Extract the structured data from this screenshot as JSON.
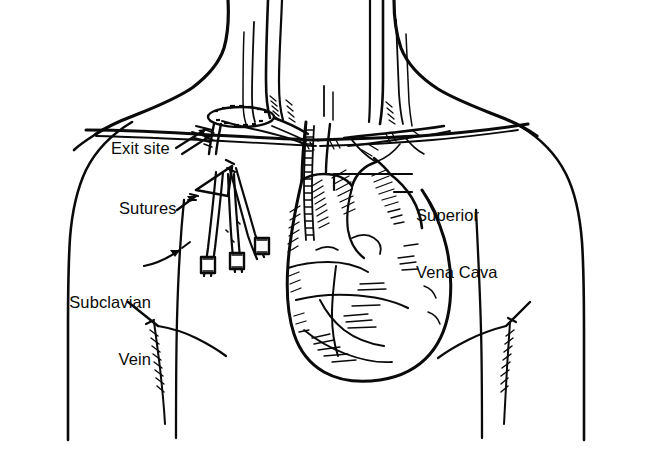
{
  "figure": {
    "background_color": "#ffffff",
    "ink_color": "#0a0a0a",
    "width": 652,
    "height": 450,
    "style": "black and white pen-and-ink line drawing with hatch shading"
  },
  "labels": [
    {
      "name": "exit-site",
      "text": "Exit site",
      "leader": "diagonal lines pointing up-right to catheter exit at the chest wall"
    },
    {
      "name": "sutures",
      "text": "Sutures",
      "leader": "short arrow pointing up-right to the suture wing"
    },
    {
      "name": "subclavian-vein",
      "line1": "Subclavian",
      "line2": "Vein",
      "leader": "curved arrow pointing up-right to the subclavian vein"
    },
    {
      "name": "superior-vena-cava",
      "line1": "Superior",
      "line2": "Vena Cava",
      "leader": "two horizontal bracket lines pointing left to the superior vena cava"
    }
  ],
  "anatomy": [
    {
      "name": "neck-outline",
      "label": "Neck"
    },
    {
      "name": "left-shoulder-outline",
      "label": "Left shoulder and arm"
    },
    {
      "name": "right-shoulder-outline",
      "label": "Right shoulder and arm"
    },
    {
      "name": "internal-jugular-veins",
      "label": "Internal jugular veins"
    },
    {
      "name": "carotid-arteries",
      "label": "Carotid arteries"
    },
    {
      "name": "clavicle",
      "label": "Clavicle"
    },
    {
      "name": "subclavian-vein-vessel",
      "label": "Subclavian vein"
    },
    {
      "name": "superior-vena-cava-vessel",
      "label": "Superior vena cava"
    },
    {
      "name": "aortic-arch",
      "label": "Aortic arch"
    },
    {
      "name": "heart",
      "label": "Heart"
    },
    {
      "name": "left-breast",
      "label": "Left breast"
    },
    {
      "name": "right-breast",
      "label": "Right breast"
    },
    {
      "name": "catheter-tube",
      "label": "Tunneled central venous catheter"
    },
    {
      "name": "suture-wing",
      "label": "Triangular suture wing"
    },
    {
      "name": "catheter-lumens",
      "label": "Three catheter lumen extensions with clamps"
    }
  ]
}
